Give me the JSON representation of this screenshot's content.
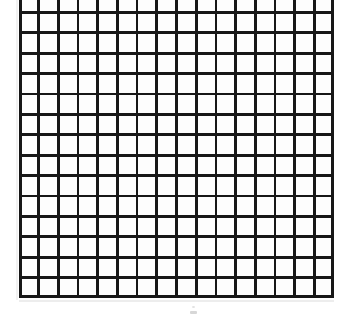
{
  "document": {
    "kind": "scanned-graph-paper",
    "title": "Graph paper grid",
    "description": "A photocopied square grid / graph paper sheet with no labels or text."
  },
  "grid": {
    "columns": 16,
    "rows": 15,
    "cell_width_px": 19.7,
    "cell_height_px": 20.4,
    "line_color": "#171717",
    "line_width_px": 2.7,
    "cell_fill_color": "#fdfdfd",
    "left_px": 19,
    "right_px": 334,
    "top_px": -8,
    "bottom_px": 298,
    "top_row_clipped": true
  },
  "page": {
    "background_color": "#ffffff",
    "width_px": 355,
    "height_px": 319
  },
  "artifacts": {
    "smudge_label": "",
    "smudge_color": "#c9c9c9",
    "baseline_shadow_color": "#ededed"
  },
  "labels": {
    "axis_x": "",
    "axis_y": "",
    "caption": ""
  }
}
